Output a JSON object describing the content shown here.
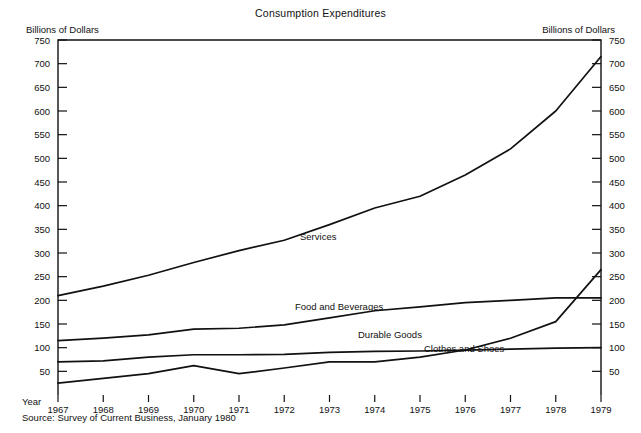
{
  "title": "Consumption Expenditures",
  "axis_unit_left": "Billions of Dollars",
  "axis_unit_right": "Billions of Dollars",
  "year_axis_label": "Year",
  "source": "Source: Survey of Current Business, January 1980",
  "labels": {
    "services": "Services",
    "food_and_beverages": "Food and Beverages",
    "durable_goods": "Durable Goods",
    "clothes_and_shoes": "Clothes and Shoes"
  },
  "colors": {
    "line": "#111111",
    "axis": "#111111",
    "background": "#ffffff"
  },
  "chart_data": {
    "type": "line",
    "title": "Consumption Expenditures",
    "xlabel": "Year",
    "ylabel": "Billions of Dollars",
    "x": [
      1967,
      1968,
      1969,
      1970,
      1971,
      1972,
      1973,
      1974,
      1975,
      1976,
      1977,
      1978,
      1979
    ],
    "xlim": [
      1967,
      1979
    ],
    "ylim": [
      0,
      750
    ],
    "yticks": [
      50,
      100,
      150,
      200,
      250,
      300,
      350,
      400,
      450,
      500,
      550,
      600,
      650,
      700,
      750
    ],
    "xticks": [
      "1967",
      "1968",
      "1969",
      "1970",
      "1971",
      "1972",
      "1973",
      "1974",
      "1975",
      "1976",
      "1977",
      "1978",
      "1979"
    ],
    "grid": false,
    "legend": "inline-labels",
    "dual_y_axis": true,
    "series": [
      {
        "name": "Services",
        "values": [
          210,
          230,
          253,
          280,
          305,
          327,
          360,
          395,
          420,
          465,
          520,
          600,
          715
        ]
      },
      {
        "name": "Food and Beverages",
        "values": [
          115,
          120,
          127,
          139,
          141,
          148,
          163,
          178,
          186,
          195,
          200,
          205,
          205
        ]
      },
      {
        "name": "Clothes and Shoes",
        "values": [
          70,
          72,
          80,
          85,
          85,
          86,
          90,
          92,
          93,
          95,
          97,
          99,
          100
        ]
      },
      {
        "name": "Durable Goods",
        "values": [
          25,
          35,
          45,
          62,
          45,
          57,
          70,
          70,
          80,
          95,
          120,
          155,
          265
        ]
      }
    ]
  }
}
